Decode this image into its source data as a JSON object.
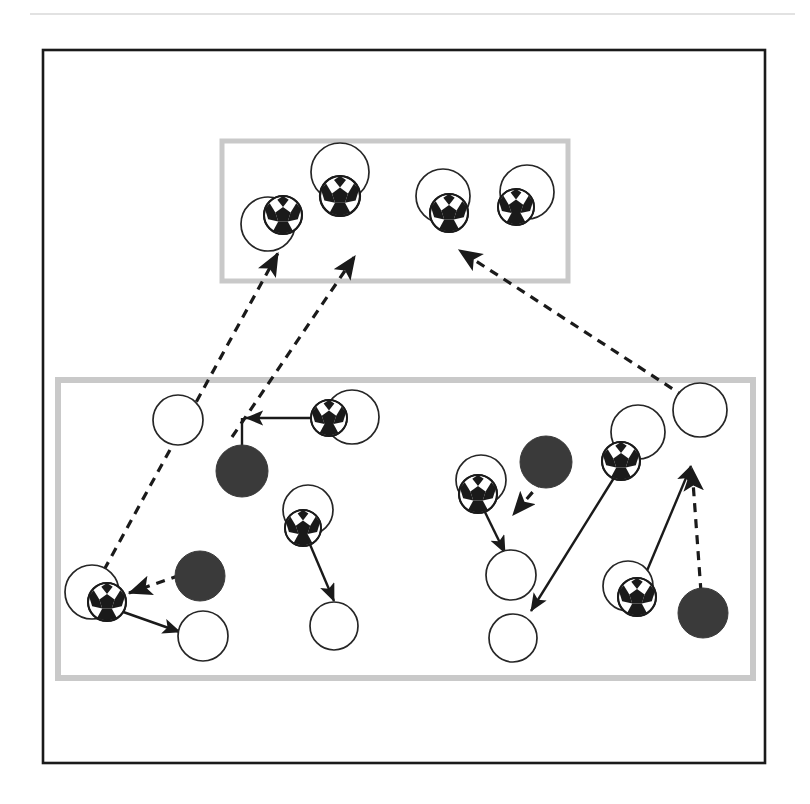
{
  "page": {
    "width": 810,
    "height": 804,
    "background": "#ffffff"
  },
  "colors": {
    "outer_frame_stroke": "#1a1a1a",
    "zone_box_stroke": "#c9c9c9",
    "player_circle_stroke": "#262626",
    "player_circle_fill": "#ffffff",
    "opponent_fill": "#3a3a3a",
    "ball_black": "#1a1a1a",
    "ball_white": "#ffffff",
    "arrow_solid": "#1a1a1a",
    "arrow_dashed": "#1a1a1a",
    "top_rule": "#d8d8d8"
  },
  "top_rule": {
    "name": "top-divider-rule",
    "x1": 30,
    "y1": 14,
    "x2": 795,
    "y2": 14
  },
  "outer_frame": {
    "name": "pitch-outer-frame",
    "x": 43,
    "y": 50,
    "width": 722,
    "height": 713,
    "stroke_width": 2.6
  },
  "zones": [
    {
      "name": "attacking-third-zone",
      "label": "top-zone",
      "x": 222,
      "y": 141,
      "width": 346,
      "height": 140,
      "stroke_width": 5
    },
    {
      "name": "midfield-zone",
      "label": "bottom-zone",
      "x": 58,
      "y": 380,
      "width": 695,
      "height": 298,
      "stroke_width": 6
    }
  ],
  "players": [
    {
      "name": "player-top-left",
      "cx": 268,
      "cy": 224,
      "r": 27,
      "zone": "top-zone"
    },
    {
      "name": "player-top-centerleft",
      "cx": 340,
      "cy": 172,
      "r": 29,
      "zone": "top-zone"
    },
    {
      "name": "player-top-centerright",
      "cx": 443,
      "cy": 196,
      "r": 27,
      "zone": "top-zone"
    },
    {
      "name": "player-top-right",
      "cx": 527,
      "cy": 192,
      "r": 27,
      "zone": "top-zone"
    },
    {
      "name": "player-mid-leftpost",
      "cx": 178,
      "cy": 420,
      "r": 25,
      "zone": "bottom-zone"
    },
    {
      "name": "player-mid-ballcarrier1",
      "cx": 352,
      "cy": 417,
      "r": 27,
      "zone": "bottom-zone"
    },
    {
      "name": "player-mid-center",
      "cx": 308,
      "cy": 510,
      "r": 25,
      "zone": "bottom-zone"
    },
    {
      "name": "player-mid-centerlow",
      "cx": 334,
      "cy": 626,
      "r": 24,
      "zone": "bottom-zone"
    },
    {
      "name": "player-mid-leftlow",
      "cx": 92,
      "cy": 592,
      "r": 27,
      "zone": "bottom-zone"
    },
    {
      "name": "player-mid-leftlow2",
      "cx": 203,
      "cy": 636,
      "r": 25,
      "zone": "bottom-zone"
    },
    {
      "name": "player-mid-rightA",
      "cx": 481,
      "cy": 480,
      "r": 25,
      "zone": "bottom-zone"
    },
    {
      "name": "player-mid-rightB",
      "cx": 511,
      "cy": 575,
      "r": 25,
      "zone": "bottom-zone"
    },
    {
      "name": "player-mid-rightC",
      "cx": 513,
      "cy": 638,
      "r": 24,
      "zone": "bottom-zone"
    },
    {
      "name": "player-mid-rightD",
      "cx": 638,
      "cy": 432,
      "r": 27,
      "zone": "bottom-zone"
    },
    {
      "name": "player-mid-rightE",
      "cx": 700,
      "cy": 410,
      "r": 27,
      "zone": "bottom-zone"
    },
    {
      "name": "player-mid-rightF",
      "cx": 628,
      "cy": 586,
      "r": 25,
      "zone": "bottom-zone"
    }
  ],
  "balls": [
    {
      "name": "ball-top-left",
      "cx": 283,
      "cy": 215,
      "r": 19
    },
    {
      "name": "ball-top-centerleft",
      "cx": 340,
      "cy": 196,
      "r": 20
    },
    {
      "name": "ball-top-centerright",
      "cx": 449,
      "cy": 213,
      "r": 19
    },
    {
      "name": "ball-top-right",
      "cx": 516,
      "cy": 207,
      "r": 18
    },
    {
      "name": "ball-mid-carrier1",
      "cx": 329,
      "cy": 418,
      "r": 18
    },
    {
      "name": "ball-mid-center",
      "cx": 303,
      "cy": 528,
      "r": 18
    },
    {
      "name": "ball-mid-leftlow",
      "cx": 107,
      "cy": 602,
      "r": 19
    },
    {
      "name": "ball-mid-rightA",
      "cx": 478,
      "cy": 494,
      "r": 19
    },
    {
      "name": "ball-mid-rightD",
      "cx": 621,
      "cy": 461,
      "r": 19
    },
    {
      "name": "ball-mid-rightF",
      "cx": 637,
      "cy": 597,
      "r": 19
    }
  ],
  "opponents": [
    {
      "name": "opponent-mid-upperleft",
      "cx": 242,
      "cy": 471,
      "r": 26
    },
    {
      "name": "opponent-mid-lowerleft",
      "cx": 200,
      "cy": 576,
      "r": 25
    },
    {
      "name": "opponent-mid-center",
      "cx": 546,
      "cy": 462,
      "r": 26
    },
    {
      "name": "opponent-mid-right",
      "cx": 703,
      "cy": 613,
      "r": 25
    }
  ],
  "arrows": [
    {
      "name": "pass-arrow-carrier1-left",
      "style": "solid",
      "x1": 329,
      "y1": 418,
      "x2": 246,
      "y2": 418
    },
    {
      "name": "run-line-carrier1-opponent",
      "style": "solid",
      "x1": 242,
      "y1": 418,
      "x2": 242,
      "y2": 447,
      "arrow": false
    },
    {
      "name": "pass-arrow-midcenter-down",
      "style": "solid",
      "x1": 303,
      "y1": 528,
      "x2": 334,
      "y2": 601
    },
    {
      "name": "pass-arrow-leftlow-down",
      "style": "solid",
      "x1": 112,
      "y1": 608,
      "x2": 180,
      "y2": 632
    },
    {
      "name": "press-arrow-opponent-to-leftlow",
      "style": "dashed",
      "x1": 195,
      "y1": 570,
      "x2": 129,
      "y2": 593
    },
    {
      "name": "pass-arrow-rightA-down",
      "style": "solid",
      "x1": 481,
      "y1": 504,
      "x2": 505,
      "y2": 553
    },
    {
      "name": "press-arrow-opponent-center",
      "style": "dashed",
      "x1": 543,
      "y1": 480,
      "x2": 513,
      "y2": 515
    },
    {
      "name": "pass-arrow-rightD-downleft",
      "style": "solid",
      "x1": 617,
      "y1": 473,
      "x2": 531,
      "y2": 611
    },
    {
      "name": "pass-arrow-rightF-up",
      "style": "solid",
      "x1": 641,
      "y1": 585,
      "x2": 691,
      "y2": 466
    },
    {
      "name": "press-arrow-opponent-right",
      "style": "dashed",
      "x1": 701,
      "y1": 592,
      "x2": 692,
      "y2": 468
    },
    {
      "name": "switch-arrow-leftlow-to-topleft",
      "style": "dashed",
      "x1": 104,
      "y1": 570,
      "x2": 278,
      "y2": 253
    },
    {
      "name": "switch-arrow-midleft-to-topcenter",
      "style": "dashed",
      "x1": 232,
      "y1": 437,
      "x2": 355,
      "y2": 256
    },
    {
      "name": "switch-arrow-righte-to-topright",
      "style": "dashed",
      "x1": 699,
      "y1": 406,
      "x2": 459,
      "y2": 250
    }
  ]
}
